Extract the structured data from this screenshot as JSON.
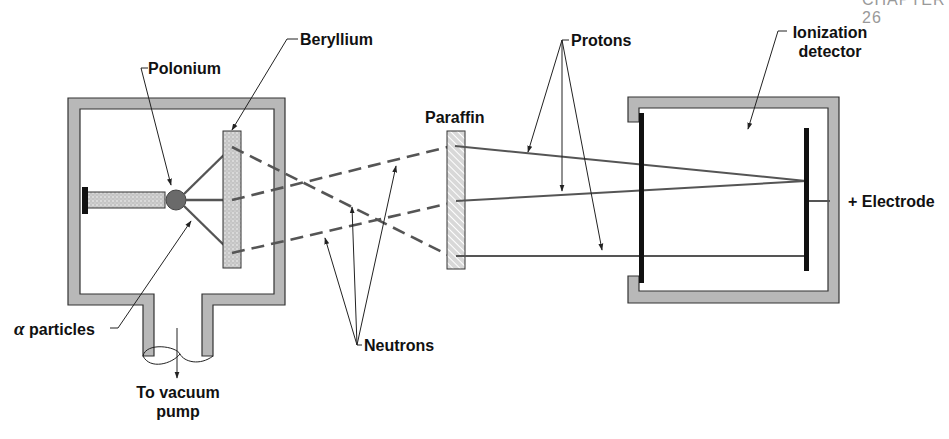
{
  "header": {
    "chapter": "CHAPTER 26"
  },
  "labels": {
    "polonium": "Polonium",
    "beryllium": "Beryllium",
    "alpha_particles_symbol": "α",
    "alpha_particles": "particles",
    "to_vacuum_pump_line1": "To vacuum",
    "to_vacuum_pump_line2": "pump",
    "neutrons": "Neutrons",
    "paraffin": "Paraffin",
    "protons": "Protons",
    "ionization_detector_line1": "Ionization",
    "ionization_detector_line2": "detector",
    "electrode": "+ Electrode"
  },
  "colors": {
    "wall_fill": "#b8b8b8",
    "wall_stroke": "#333333",
    "beam": "#555555",
    "polonium": "#6a6a6a",
    "plate": "#111111"
  }
}
